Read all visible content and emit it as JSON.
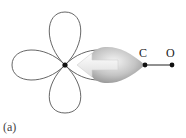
{
  "figure": {
    "panel_label": "(a)",
    "atoms": {
      "metal": {
        "label": ""
      },
      "carbon": {
        "label": "C"
      },
      "oxygen": {
        "label": "O"
      }
    },
    "colors": {
      "orbital_outline": "#555555",
      "donor_lobe_light": "#f2f2f2",
      "donor_lobe_dark": "#8f8f8f",
      "arrow_fill": "#e8e8e8",
      "atom_dot": "#111111",
      "bond": "#222222"
    }
  }
}
